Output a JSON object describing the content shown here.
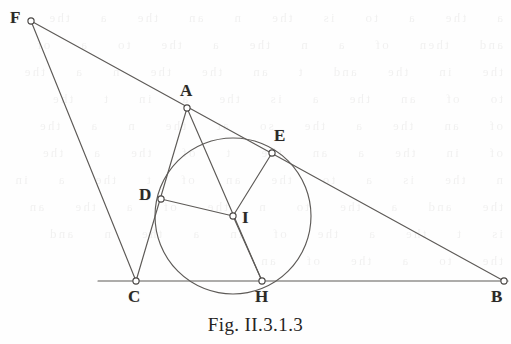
{
  "figure": {
    "caption": "Fig. II.3.1.3",
    "background_color": "#fefefe",
    "stroke_color": "#5d5a57",
    "label_color": "#2b2926",
    "ghost_text": "a  the  a  to  is  the  n  an  the  a  the  and  then  of  a  n  the  a  the  to  a  of  the  in  the  and  t  an  the  the  n  a  the  to  of  an  the  a  is  the  a  in  t  the  of  an  the  a  the  so  at  the  n  a  the  of  in  the  a  an  the  t  of  the  a  the  n  the  is  a  to  the  an  of  t  the  a  in  the  and  a  the  to  n  the  of  a  the  an  is  t  the  a  the  of  in  a  the  n  and  the  to  a  the  of  an",
    "points": [
      {
        "id": "F",
        "label": "F",
        "x": 31,
        "y": 21,
        "label_x": 10,
        "label_y": 9
      },
      {
        "id": "A",
        "label": "A",
        "x": 187,
        "y": 108,
        "label_x": 180,
        "label_y": 82
      },
      {
        "id": "E",
        "label": "E",
        "x": 272,
        "y": 153,
        "label_x": 274,
        "label_y": 127
      },
      {
        "id": "B",
        "label": "B",
        "x": 504,
        "y": 281,
        "label_x": 491,
        "label_y": 288
      },
      {
        "id": "D",
        "label": "D",
        "x": 161,
        "y": 199,
        "label_x": 139,
        "label_y": 186
      },
      {
        "id": "I",
        "label": "I",
        "x": 233,
        "y": 216,
        "label_x": 242,
        "label_y": 209
      },
      {
        "id": "C",
        "label": "C",
        "x": 136,
        "y": 281,
        "label_x": 128,
        "label_y": 288
      },
      {
        "id": "H",
        "label": "H",
        "x": 262,
        "y": 281,
        "label_x": 255,
        "label_y": 288
      }
    ],
    "circle": {
      "name": "incircle",
      "center_x": 233,
      "center_y": 216,
      "radius": 78
    },
    "segments": [
      {
        "name": "segment-F-B",
        "from": "F",
        "to": "B",
        "x1": 31,
        "y1": 21,
        "x2": 504,
        "y2": 281
      },
      {
        "name": "segment-F-C",
        "from": "F",
        "to": "C",
        "x1": 31,
        "y1": 21,
        "x2": 136,
        "y2": 281
      },
      {
        "name": "segment-A-C",
        "from": "A",
        "to": "C",
        "x1": 187,
        "y1": 108,
        "x2": 136,
        "y2": 281
      },
      {
        "name": "segment-A-H",
        "from": "A",
        "to": "H",
        "x1": 187,
        "y1": 108,
        "x2": 262,
        "y2": 281
      },
      {
        "name": "segment-D-I",
        "from": "D",
        "to": "I",
        "x1": 161,
        "y1": 199,
        "x2": 233,
        "y2": 216
      },
      {
        "name": "segment-E-I",
        "from": "E",
        "to": "I",
        "x1": 272,
        "y1": 153,
        "x2": 233,
        "y2": 216
      },
      {
        "name": "segment-I-H",
        "from": "I",
        "to": "H",
        "x1": 233,
        "y1": 216,
        "x2": 262,
        "y2": 281
      },
      {
        "name": "baseline-C-B",
        "from": "C",
        "to": "B",
        "x1": 98,
        "y1": 281,
        "x2": 508,
        "y2": 281
      }
    ]
  }
}
